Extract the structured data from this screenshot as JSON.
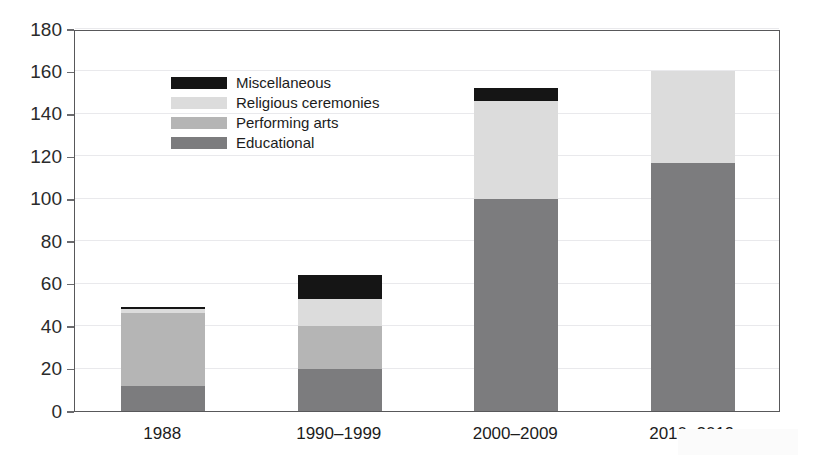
{
  "chart_data": {
    "type": "bar",
    "stacked": true,
    "title": "",
    "subtitle": "",
    "xlabel": "",
    "ylabel": "",
    "categories": [
      "1988",
      "1990–1999",
      "2000–2009",
      "2010–2019"
    ],
    "series": [
      {
        "name": "Educational",
        "color": "#7c7c7e",
        "values": [
          12,
          20,
          100,
          117
        ]
      },
      {
        "name": "Performing arts",
        "color": "#b5b5b5",
        "values": [
          34,
          20,
          0,
          0
        ]
      },
      {
        "name": "Religious ceremonies",
        "color": "#dcdcdc",
        "values": [
          2,
          13,
          46,
          43
        ]
      },
      {
        "name": "Miscellaneous",
        "color": "#151515",
        "values": [
          1,
          11,
          6,
          0
        ]
      }
    ],
    "totals": [
      49,
      64,
      152,
      160
    ],
    "ylim": [
      0,
      180
    ],
    "ytick_step": 20,
    "yticks": [
      0,
      20,
      40,
      60,
      80,
      100,
      120,
      140,
      160,
      180
    ],
    "ytick_labels": [
      "0",
      "20",
      "40",
      "60",
      "80",
      "100",
      "120",
      "140",
      "160",
      "180"
    ],
    "grid": true,
    "grid_axis": "y",
    "grid_color": "#e9e9ec",
    "legend_position": "top-left",
    "legend_order": [
      "Miscellaneous",
      "Religious ceremonies",
      "Performing arts",
      "Educational"
    ],
    "plot_border_color": "#58585a",
    "background_color": "#ffffff",
    "stack_order_bottom_to_top": [
      "Educational",
      "Performing arts",
      "Religious ceremonies",
      "Miscellaneous"
    ]
  },
  "legend": {
    "items": [
      {
        "label": "Miscellaneous",
        "color": "#151515"
      },
      {
        "label": "Religious ceremonies",
        "color": "#dcdcdc"
      },
      {
        "label": "Performing arts",
        "color": "#b5b5b5"
      },
      {
        "label": "Educational",
        "color": "#7c7c7e"
      }
    ]
  }
}
